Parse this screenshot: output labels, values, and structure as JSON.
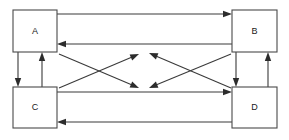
{
  "diagram": {
    "canvas": {
      "width": 289,
      "height": 140,
      "background": "#ffffff"
    },
    "style": {
      "line_color": "#3a3a3a",
      "box_stroke": "#4a4a4a",
      "box_fill": "#ffffff",
      "label_color": "#1a1a1a"
    },
    "nodes": [
      {
        "id": "A",
        "label": "A",
        "x": 13,
        "y": 10,
        "w": 44,
        "h": 42,
        "cx": 35,
        "cy": 31
      },
      {
        "id": "B",
        "label": "B",
        "x": 232,
        "y": 10,
        "w": 45,
        "h": 42,
        "cx": 254.5,
        "cy": 31
      },
      {
        "id": "C",
        "label": "C",
        "x": 13,
        "y": 87,
        "w": 44,
        "h": 41,
        "cx": 35,
        "cy": 107.5
      },
      {
        "id": "D",
        "label": "D",
        "x": 232,
        "y": 87,
        "w": 45,
        "h": 41,
        "cx": 254.5,
        "cy": 107.5
      }
    ],
    "edges": [
      {
        "id": "a-to-b",
        "from": "A",
        "to": "B",
        "kind": "horizontal",
        "direction": "right",
        "x1": 57,
        "y1": 14,
        "x2": 232,
        "y2": 14
      },
      {
        "id": "b-to-a",
        "from": "B",
        "to": "A",
        "kind": "horizontal",
        "direction": "left",
        "x1": 232,
        "y1": 44,
        "x2": 57,
        "y2": 44
      },
      {
        "id": "c-to-d",
        "from": "C",
        "to": "D",
        "kind": "horizontal",
        "direction": "right",
        "x1": 57,
        "y1": 92,
        "x2": 232,
        "y2": 92
      },
      {
        "id": "d-to-c",
        "from": "D",
        "to": "C",
        "kind": "horizontal",
        "direction": "left",
        "x1": 232,
        "y1": 122,
        "x2": 57,
        "y2": 122
      },
      {
        "id": "a-to-c",
        "from": "A",
        "to": "C",
        "kind": "vertical",
        "direction": "down",
        "x1": 18,
        "y1": 52,
        "x2": 18,
        "y2": 87
      },
      {
        "id": "c-to-a",
        "from": "C",
        "to": "A",
        "kind": "vertical",
        "direction": "up",
        "x1": 42,
        "y1": 87,
        "x2": 42,
        "y2": 52
      },
      {
        "id": "b-to-d",
        "from": "B",
        "to": "D",
        "kind": "vertical",
        "direction": "down",
        "x1": 236,
        "y1": 52,
        "x2": 236,
        "y2": 87
      },
      {
        "id": "d-to-b",
        "from": "D",
        "to": "B",
        "kind": "vertical",
        "direction": "up",
        "x1": 268,
        "y1": 87,
        "x2": 268,
        "y2": 52
      },
      {
        "id": "diag-left-up",
        "from": "C",
        "to": "B",
        "kind": "diagonal",
        "direction": "up-right",
        "x1": 59,
        "y1": 88,
        "x2": 139,
        "y2": 54
      },
      {
        "id": "diag-left-down",
        "from": "A",
        "to": "D",
        "kind": "diagonal",
        "direction": "down-right",
        "x1": 59,
        "y1": 54,
        "x2": 139,
        "y2": 88
      },
      {
        "id": "diag-right-up",
        "from": "D",
        "to": "A",
        "kind": "diagonal",
        "direction": "up-left",
        "x1": 231,
        "y1": 88,
        "x2": 149,
        "y2": 53
      },
      {
        "id": "diag-right-down",
        "from": "B",
        "to": "C",
        "kind": "diagonal",
        "direction": "down-left",
        "x1": 231,
        "y1": 54,
        "x2": 149,
        "y2": 88
      }
    ]
  }
}
